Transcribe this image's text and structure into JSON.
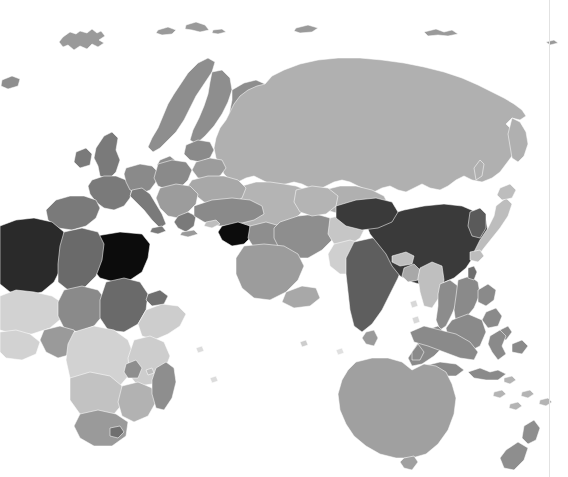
{
  "figure": {
    "type": "choropleth-world-map",
    "title": "",
    "subtitle": "",
    "projection": "equirectangular",
    "background_color": "#ffffff",
    "ocean_color": "#ffffff",
    "border_color": "#ffffff",
    "divider_color": "#e2e2e2",
    "divider_x": 549,
    "width": 568,
    "height": 477,
    "view_extent_note": "Eastern hemisphere: Europe, Africa, Asia, Oceania; cropped at left edge"
  },
  "legend": {
    "visible": false,
    "position": "none",
    "title": "",
    "entries": []
  },
  "scale": {
    "type": "sequential-grayscale",
    "description": "Darker shade indicates a higher value",
    "stops": [
      {
        "label": "lowest",
        "color": "#e3e3e3"
      },
      {
        "label": "low",
        "color": "#d2d2d2"
      },
      {
        "label": "mid-low",
        "color": "#bdbdbd"
      },
      {
        "label": "mid",
        "color": "#a8a8a8"
      },
      {
        "label": "mid-high",
        "color": "#8e8e8e"
      },
      {
        "label": "high",
        "color": "#6f6f6f"
      },
      {
        "label": "higher",
        "color": "#565656"
      },
      {
        "label": "highest",
        "color": "#0c0c0c"
      }
    ],
    "no_data_color": "#ffffff"
  },
  "chart_data": {
    "type": "map",
    "title": "",
    "xlabel": "",
    "ylabel": "",
    "colorbar": "grayscale sequential, light = low, dark = high",
    "regions": [
      {
        "name": "Russia",
        "color": "#b0b0b0",
        "bin": "mid-low"
      },
      {
        "name": "China",
        "color": "#3a3a3a",
        "bin": "higher"
      },
      {
        "name": "India",
        "color": "#5e5e5e",
        "bin": "high"
      },
      {
        "name": "Egypt",
        "color": "#0c0c0c",
        "bin": "highest"
      },
      {
        "name": "Syria",
        "color": "#0c0c0c",
        "bin": "highest"
      },
      {
        "name": "Algeria",
        "color": "#2a2a2a",
        "bin": "highest"
      },
      {
        "name": "Libya",
        "color": "#6a6a6a",
        "bin": "high"
      },
      {
        "name": "Sudan",
        "color": "#6a6a6a",
        "bin": "high"
      },
      {
        "name": "Turkey",
        "color": "#8a8a8a",
        "bin": "mid-high"
      },
      {
        "name": "Iran",
        "color": "#8e8e8e",
        "bin": "mid-high"
      },
      {
        "name": "Saudi Arabia",
        "color": "#9c9c9c",
        "bin": "mid"
      },
      {
        "name": "Kazakhstan",
        "color": "#b4b4b4",
        "bin": "mid-low"
      },
      {
        "name": "Mongolia",
        "color": "#b0b0b0",
        "bin": "mid-low"
      },
      {
        "name": "Japan",
        "color": "#bdbdbd",
        "bin": "mid-low"
      },
      {
        "name": "Indonesia",
        "color": "#8a8a8a",
        "bin": "mid-high"
      },
      {
        "name": "Australia",
        "color": "#a0a0a0",
        "bin": "mid"
      },
      {
        "name": "New Zealand",
        "color": "#a0a0a0",
        "bin": "mid"
      },
      {
        "name": "Papua New Guinea",
        "color": "#8a8a8a",
        "bin": "mid-high"
      },
      {
        "name": "Scandinavia",
        "color": "#8e8e8e",
        "bin": "mid-high"
      },
      {
        "name": "Western Europe",
        "color": "#7a7a7a",
        "bin": "high"
      },
      {
        "name": "Eastern Europe",
        "color": "#9c9c9c",
        "bin": "mid"
      },
      {
        "name": "Ukraine",
        "color": "#a8a8a8",
        "bin": "mid"
      },
      {
        "name": "Central Africa",
        "color": "#d2d2d2",
        "bin": "low"
      },
      {
        "name": "Ethiopia",
        "color": "#cdcdcd",
        "bin": "low"
      },
      {
        "name": "South Africa",
        "color": "#9a9a9a",
        "bin": "mid"
      },
      {
        "name": "Madagascar",
        "color": "#8e8e8e",
        "bin": "mid-high"
      },
      {
        "name": "Pakistan",
        "color": "#cfcfcf",
        "bin": "low"
      },
      {
        "name": "Afghanistan",
        "color": "#c6c6c6",
        "bin": "low"
      },
      {
        "name": "Myanmar",
        "color": "#bfbfbf",
        "bin": "mid-low"
      },
      {
        "name": "Thailand",
        "color": "#8c8c8c",
        "bin": "mid-high"
      },
      {
        "name": "Vietnam",
        "color": "#8a8a8a",
        "bin": "mid-high"
      },
      {
        "name": "Greenland-Svalbard",
        "color": "#9a9a9a",
        "bin": "mid"
      }
    ]
  }
}
